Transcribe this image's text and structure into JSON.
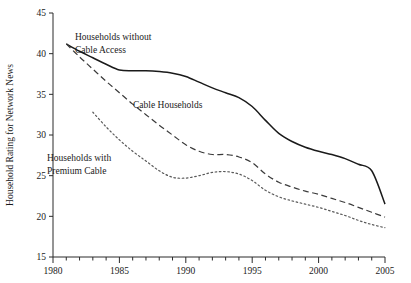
{
  "chart_data": {
    "type": "line",
    "title": "",
    "subtitle": "",
    "xlabel": "",
    "ylabel": "Household Rating for Network News",
    "xlim": [
      1980,
      2005
    ],
    "ylim": [
      15,
      45
    ],
    "grid": false,
    "legend": "inline-annotations",
    "x_ticks_major": [
      1980,
      1985,
      1990,
      1995,
      2000,
      2005
    ],
    "x_tick_labels": [
      "1980",
      "1985",
      "1990",
      "1995",
      "2000",
      "2005"
    ],
    "x_ticks_minor_step": 1,
    "y_ticks": [
      15,
      20,
      25,
      30,
      35,
      40,
      45
    ],
    "y_tick_labels": [
      "15",
      "20",
      "25",
      "30",
      "35",
      "40",
      "45"
    ],
    "annotations": [
      {
        "name": "households-without-cable-access",
        "line1": "Households without",
        "line2": "Cable Access",
        "x": 75,
        "y": 40
      },
      {
        "name": "cable-households",
        "line1": "Cable  Households",
        "line2": "",
        "x": 133,
        "y": 108
      },
      {
        "name": "households-with-premium-cable",
        "line1": "Households with",
        "line2": "Premium Cable",
        "x": 47,
        "y": 161
      }
    ],
    "series": [
      {
        "name": "Households without Cable Access",
        "style": "solid",
        "color": "#1a1a1a",
        "x": [
          1981,
          1982,
          1983,
          1984,
          1985,
          1986,
          1987,
          1988,
          1989,
          1990,
          1991,
          1992,
          1993,
          1994,
          1995,
          1996,
          1997,
          1998,
          1999,
          2000,
          2001,
          2002,
          2003,
          2004,
          2005
        ],
        "values": [
          41.2,
          40.3,
          39.5,
          38.7,
          38.0,
          37.9,
          37.9,
          37.8,
          37.6,
          37.2,
          36.5,
          35.8,
          35.2,
          34.6,
          33.5,
          31.8,
          30.2,
          29.2,
          28.5,
          28.0,
          27.6,
          27.1,
          26.4,
          25.6,
          21.5
        ]
      },
      {
        "name": "Cable Households",
        "style": "dashed",
        "color": "#3a3a3a",
        "x": [
          1981,
          1982,
          1983,
          1984,
          1985,
          1986,
          1987,
          1988,
          1989,
          1990,
          1991,
          1992,
          1993,
          1994,
          1995,
          1996,
          1997,
          1998,
          1999,
          2000,
          2001,
          2002,
          2003,
          2004,
          2005
        ],
        "values": [
          41.2,
          39.6,
          38.1,
          36.6,
          35.2,
          33.8,
          32.5,
          31.2,
          30.0,
          28.8,
          28.0,
          27.6,
          27.6,
          27.3,
          26.6,
          25.2,
          24.2,
          23.6,
          23.1,
          22.7,
          22.2,
          21.7,
          21.1,
          20.5,
          19.9
        ]
      },
      {
        "name": "Households with Premium Cable",
        "style": "dotted",
        "color": "#5a5a5a",
        "x": [
          1983,
          1984,
          1985,
          1986,
          1987,
          1988,
          1989,
          1990,
          1991,
          1992,
          1993,
          1994,
          1995,
          1996,
          1997,
          1998,
          1999,
          2000,
          2001,
          2002,
          2003,
          2004,
          2005
        ],
        "values": [
          32.8,
          31.0,
          29.4,
          28.0,
          26.8,
          25.6,
          24.8,
          24.7,
          25.0,
          25.4,
          25.5,
          25.2,
          24.4,
          23.2,
          22.4,
          21.9,
          21.5,
          21.1,
          20.6,
          20.1,
          19.5,
          19.0,
          18.6
        ]
      }
    ]
  },
  "plot_geometry": {
    "left": 53,
    "right": 385,
    "top": 13,
    "bottom": 257
  }
}
